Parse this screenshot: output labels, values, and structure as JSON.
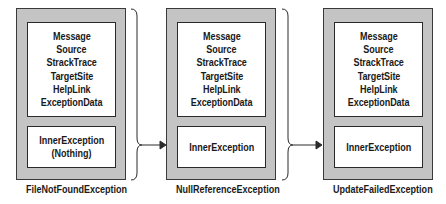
{
  "diagram": {
    "exceptions": [
      {
        "name": "FileNotFoundException",
        "properties": [
          "Message",
          "Source",
          "StrackTrace",
          "TargetSite",
          "HelpLink",
          "ExceptionData"
        ],
        "inner_label": "InnerException",
        "inner_value": "(Nothing)"
      },
      {
        "name": "NullReferenceException",
        "properties": [
          "Message",
          "Source",
          "StrackTrace",
          "TargetSite",
          "HelpLink",
          "ExceptionData"
        ],
        "inner_label": "InnerException",
        "inner_value": ""
      },
      {
        "name": "UpdateFailedException",
        "properties": [
          "Message",
          "Source",
          "StrackTrace",
          "TargetSite",
          "HelpLink",
          "ExceptionData"
        ],
        "inner_label": "InnerException",
        "inner_value": ""
      }
    ],
    "connections": [
      {
        "from": "FileNotFoundException",
        "to": "NullReferenceException"
      },
      {
        "from": "NullReferenceException",
        "to": "UpdateFailedException"
      }
    ],
    "colors": {
      "outer_fill": "#c4c4c4",
      "inner_fill": "#ffffff",
      "stroke": "#2a2a2a"
    }
  }
}
